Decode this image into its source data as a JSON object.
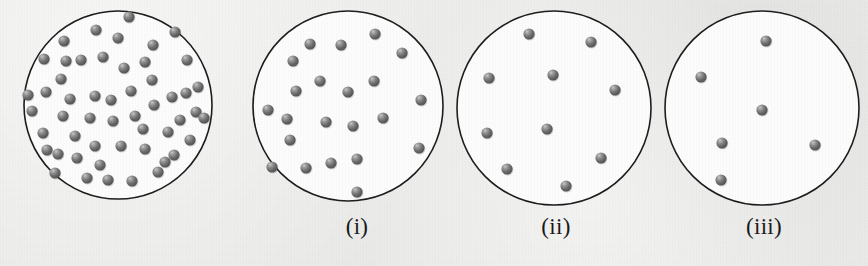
{
  "figure": {
    "background_color": "#ececea",
    "vessel_fill_color": "#fdfdfd",
    "vessel_stroke_color": "#1b1b1b",
    "particle_color": "#656565",
    "particle_highlight_color": "#d2d2d2",
    "particle_radius": 5.6
  },
  "panels": [
    {
      "id": "panel-0",
      "caption": "",
      "caption_x": 118,
      "caption_y": 214,
      "vessel": {
        "cx": 118,
        "cy": 105,
        "r": 94
      },
      "particle_count": 52,
      "particles": [
        [
          129,
          17
        ],
        [
          96,
          30
        ],
        [
          153,
          45
        ],
        [
          64,
          41
        ],
        [
          175,
          32
        ],
        [
          44,
          59
        ],
        [
          81,
          60
        ],
        [
          103,
          57
        ],
        [
          124,
          68
        ],
        [
          187,
          60
        ],
        [
          61,
          79
        ],
        [
          198,
          87
        ],
        [
          152,
          80
        ],
        [
          131,
          91
        ],
        [
          172,
          97
        ],
        [
          95,
          96
        ],
        [
          46,
          92
        ],
        [
          32,
          111
        ],
        [
          63,
          116
        ],
        [
          90,
          118
        ],
        [
          113,
          121
        ],
        [
          135,
          116
        ],
        [
          154,
          105
        ],
        [
          196,
          112
        ],
        [
          204,
          118
        ],
        [
          43,
          133
        ],
        [
          75,
          136
        ],
        [
          168,
          132
        ],
        [
          190,
          140
        ],
        [
          95,
          146
        ],
        [
          121,
          146
        ],
        [
          145,
          149
        ],
        [
          58,
          154
        ],
        [
          77,
          158
        ],
        [
          165,
          162
        ],
        [
          55,
          173
        ],
        [
          87,
          178
        ],
        [
          108,
          180
        ],
        [
          132,
          181
        ],
        [
          158,
          172
        ],
        [
          186,
          93
        ],
        [
          174,
          155
        ],
        [
          28,
          95
        ],
        [
          118,
          38
        ],
        [
          145,
          62
        ],
        [
          70,
          99
        ],
        [
          111,
          100
        ],
        [
          47,
          150
        ],
        [
          100,
          165
        ],
        [
          143,
          129
        ],
        [
          180,
          120
        ],
        [
          66,
          61
        ]
      ]
    },
    {
      "id": "panel-i",
      "caption": "(i)",
      "caption_x": 357,
      "caption_y": 214,
      "vessel": {
        "cx": 348,
        "cy": 106,
        "r": 95
      },
      "particle_count": 22,
      "particles": [
        [
          310,
          44
        ],
        [
          341,
          45
        ],
        [
          375,
          34
        ],
        [
          293,
          61
        ],
        [
          402,
          53
        ],
        [
          320,
          81
        ],
        [
          374,
          81
        ],
        [
          296,
          91
        ],
        [
          348,
          92
        ],
        [
          421,
          100
        ],
        [
          287,
          119
        ],
        [
          326,
          122
        ],
        [
          353,
          126
        ],
        [
          383,
          118
        ],
        [
          290,
          140
        ],
        [
          419,
          148
        ],
        [
          331,
          163
        ],
        [
          306,
          168
        ],
        [
          272,
          167
        ],
        [
          357,
          159
        ],
        [
          357,
          192
        ],
        [
          268,
          110
        ]
      ]
    },
    {
      "id": "panel-ii",
      "caption": "(ii)",
      "caption_x": 556,
      "caption_y": 214,
      "vessel": {
        "cx": 554,
        "cy": 108,
        "r": 97
      },
      "particle_count": 10,
      "particles": [
        [
          529,
          34
        ],
        [
          591,
          42
        ],
        [
          489,
          78
        ],
        [
          553,
          75
        ],
        [
          615,
          90
        ],
        [
          487,
          133
        ],
        [
          547,
          129
        ],
        [
          601,
          158
        ],
        [
          507,
          169
        ],
        [
          566,
          186
        ]
      ]
    },
    {
      "id": "panel-iii",
      "caption": "(iii)",
      "caption_x": 764,
      "caption_y": 214,
      "vessel": {
        "cx": 762,
        "cy": 108,
        "r": 97
      },
      "particle_count": 6,
      "particles": [
        [
          766,
          41
        ],
        [
          701,
          77
        ],
        [
          762,
          110
        ],
        [
          722,
          143
        ],
        [
          815,
          145
        ],
        [
          721,
          180
        ]
      ]
    }
  ]
}
